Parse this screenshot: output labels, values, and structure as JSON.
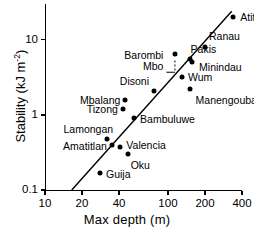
{
  "chart_data": {
    "type": "scatter",
    "title": "",
    "xlabel": "Max depth  (m)",
    "ylabel": "Stability (kJ m-2)",
    "ylabel_base": "Stability (kJ m",
    "ylabel_exp": "-2",
    "ylabel_close": ")",
    "xscale": "log",
    "yscale": "log",
    "xlim": [
      10,
      400
    ],
    "ylim": [
      0.1,
      30
    ],
    "grid": false,
    "legend": "none",
    "xticks": [
      "10",
      "20",
      "40",
      "100",
      "200",
      "400"
    ],
    "xtick_values": [
      10,
      20,
      40,
      100,
      200,
      400
    ],
    "yticks": [
      "0.1",
      "1",
      "10"
    ],
    "ytick_values": [
      0.1,
      1,
      10
    ],
    "points": [
      {
        "name": "Atitlan",
        "x": 340,
        "y": 20.0,
        "label_pos": "right"
      },
      {
        "name": "Ranau",
        "x": 200,
        "y": 8.0,
        "label_pos": "above-right"
      },
      {
        "name": "Barombi Mbo",
        "x": 115,
        "y": 6.5,
        "label_pos": "leader-left"
      },
      {
        "name": "Pakis",
        "x": 150,
        "y": 5.5,
        "label_pos": "above-right"
      },
      {
        "name": "Minindau",
        "x": 157,
        "y": 5.1,
        "label_pos": "right"
      },
      {
        "name": "Wum",
        "x": 130,
        "y": 3.2,
        "label_pos": "right"
      },
      {
        "name": "Manengouba",
        "x": 150,
        "y": 2.2,
        "label_pos": "below"
      },
      {
        "name": "Disoni",
        "x": 77,
        "y": 2.1,
        "label_pos": "above-left"
      },
      {
        "name": "Mbalang",
        "x": 45,
        "y": 1.6,
        "label_pos": "left"
      },
      {
        "name": "Tizong",
        "x": 43,
        "y": 1.2,
        "label_pos": "left"
      },
      {
        "name": "Bambuluwe",
        "x": 53,
        "y": 0.9,
        "label_pos": "right"
      },
      {
        "name": "Lamongan",
        "x": 32,
        "y": 0.48,
        "label_pos": "above-left"
      },
      {
        "name": "Amatitlan",
        "x": 35,
        "y": 0.4,
        "label_pos": "left"
      },
      {
        "name": "Valencia",
        "x": 41,
        "y": 0.37,
        "label_pos": "right"
      },
      {
        "name": "Oku",
        "x": 47,
        "y": 0.3,
        "label_pos": "below"
      },
      {
        "name": "Guija",
        "x": 28,
        "y": 0.17,
        "label_pos": "right"
      }
    ],
    "fit_line": {
      "type": "power-law regression",
      "x_start": 16.5,
      "y_start": 0.1,
      "x_end": 330,
      "y_end": 24.0
    },
    "leader": {
      "from_label": "Barombi Mbo",
      "style": "dashed",
      "x": 115,
      "y_from": 3.7,
      "y_to": 6.0
    }
  }
}
